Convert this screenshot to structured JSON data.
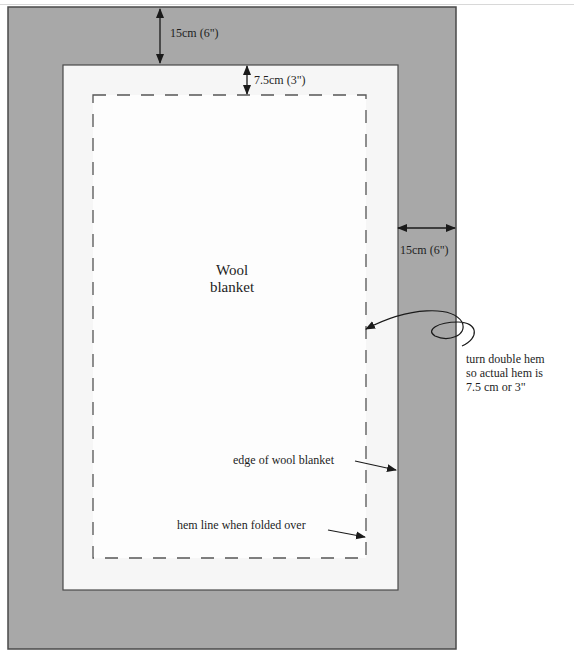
{
  "diagram": {
    "title_line1": "Wool",
    "title_line2": "blanket",
    "colors": {
      "border_fabric": "#a8a8a8",
      "blanket": "#f6f6f6",
      "hem_area": "#fdfdfd",
      "outline": "#4a4a4a",
      "dash": "#555555"
    },
    "labels": {
      "top_border": "15cm (6\")",
      "top_hem": "7.5cm (3\")",
      "side_border": "15cm (6\")",
      "note_line1": "turn double hem",
      "note_line2": "so actual hem is",
      "note_line3": "7.5 cm or 3\"",
      "edge_label": "edge of wool blanket",
      "hem_label": "hem line when folded over"
    }
  }
}
